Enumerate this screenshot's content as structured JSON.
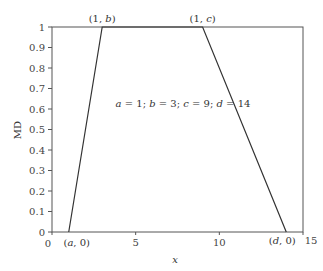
{
  "chart_data": {
    "type": "line",
    "title": "",
    "xlabel": "x",
    "ylabel": "MD",
    "xlim": [
      0,
      15
    ],
    "ylim": [
      0,
      1
    ],
    "x_ticks": [
      0,
      5,
      10,
      15
    ],
    "x_tick_labels": [
      "0",
      "5",
      "10",
      "15"
    ],
    "y_ticks": [
      0,
      0.1,
      0.2,
      0.3,
      0.4,
      0.5,
      0.6,
      0.7,
      0.8,
      0.9,
      1
    ],
    "y_tick_labels": [
      "0",
      "0.1",
      "0.2",
      "0.3",
      "0.4",
      "0.5",
      "0.6",
      "0.7",
      "0.8",
      "0.9",
      "1"
    ],
    "grid": false,
    "legend": null,
    "series": [
      {
        "name": "trapezoidal membership",
        "x": [
          1,
          3,
          9,
          14
        ],
        "y": [
          0,
          1,
          1,
          0
        ]
      }
    ],
    "parameters": {
      "a": 1,
      "b": 3,
      "c": 9,
      "d": 14
    },
    "annotations": [
      {
        "text": "(1, b)",
        "x": 3,
        "y": 1,
        "position": "above"
      },
      {
        "text": "(1, c)",
        "x": 9,
        "y": 1,
        "position": "above"
      },
      {
        "text": "(a, 0)",
        "x": 1,
        "y": 0,
        "position": "below"
      },
      {
        "text": "(d, 0)",
        "x": 14,
        "y": 0,
        "position": "below"
      },
      {
        "text": "a = 1; b = 3; c = 9; d = 14",
        "x": 6.5,
        "y": 0.6,
        "position": "center"
      }
    ]
  },
  "labels": {
    "xlabel": "x",
    "ylabel": "MD",
    "ann_b": "(1, b)",
    "ann_c": "(1, c)",
    "ann_a0": "(a, 0)",
    "ann_d0": "(d, 0)",
    "params": "a = 1; b = 3; c = 9; d = 14"
  },
  "colors": {
    "axis": "#555555",
    "line": "#333333",
    "text": "#333333"
  }
}
